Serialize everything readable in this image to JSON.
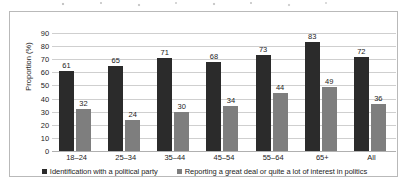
{
  "chart_data": {
    "type": "bar",
    "title": "",
    "xlabel": "",
    "ylabel": "Proportion (%)",
    "ylim": [
      0,
      90
    ],
    "ytick_step": 10,
    "yticks": [
      0,
      10,
      20,
      30,
      40,
      50,
      60,
      70,
      80,
      90
    ],
    "grid": true,
    "legend_position": "bottom",
    "categories": [
      "18–24",
      "25–34",
      "35–44",
      "45–54",
      "55–64",
      "65+",
      "All"
    ],
    "series": [
      {
        "name": "Identification with a political party",
        "color": "#2b2b2b",
        "values": [
          61,
          65,
          71,
          68,
          73,
          83,
          72
        ]
      },
      {
        "name": "Reporting a great deal or quite a lot of interest in politics",
        "color": "#7e7e7e",
        "values": [
          32,
          24,
          30,
          34,
          44,
          49,
          36
        ]
      }
    ]
  }
}
